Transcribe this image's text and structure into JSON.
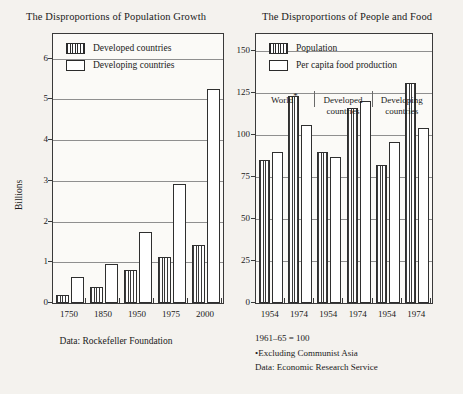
{
  "left": {
    "title": "The Disproportions of Population Growth",
    "ylabel": "Billions",
    "caption": "Data: Rockefeller Foundation",
    "legend": [
      {
        "key": "developed",
        "label": "Developed countries",
        "style": "hatch"
      },
      {
        "key": "developing",
        "label": "Developing countries",
        "style": "open"
      }
    ]
  },
  "right": {
    "title": "The Disproportions of People and Food",
    "legend": [
      {
        "key": "population",
        "label": "Population",
        "style": "hatch"
      },
      {
        "key": "food",
        "label": "Per capita food production",
        "style": "open"
      }
    ],
    "notes": [
      "1961–65 = 100",
      "•Excluding Communist  Asia",
      "Data: Economic Research Service"
    ],
    "group_labels": [
      {
        "line1": "World",
        "line2": "",
        "star": true
      },
      {
        "line1": "Developed",
        "line2": "countries",
        "star": false
      },
      {
        "line1": "Developing",
        "line2": "countries",
        "star": false
      }
    ]
  },
  "chart_data": [
    {
      "type": "bar",
      "title": "The Disproportions of Population Growth",
      "xlabel": "",
      "ylabel": "Billions",
      "categories": [
        "1750",
        "1850",
        "1950",
        "1975",
        "2000"
      ],
      "ylim": [
        0,
        6.6
      ],
      "yticks": [
        0,
        1,
        2,
        3,
        4,
        5,
        6
      ],
      "grid": true,
      "legend_position": "top-left-inside",
      "series": [
        {
          "name": "Developed countries",
          "values": [
            0.2,
            0.4,
            0.8,
            1.13,
            1.42
          ]
        },
        {
          "name": "Developing countries",
          "values": [
            0.65,
            0.95,
            1.75,
            2.93,
            5.25
          ]
        }
      ],
      "source": "Data: Rockefeller Foundation"
    },
    {
      "type": "bar",
      "title": "The Disproportions of People and Food",
      "xlabel": "",
      "ylabel": "",
      "ylim": [
        0,
        160
      ],
      "yticks": [
        0,
        25,
        50,
        75,
        100,
        125,
        150
      ],
      "grid": true,
      "legend_position": "top-left-inside",
      "groups": [
        "World*",
        "Developed countries",
        "Developing countries"
      ],
      "categories": [
        "1954",
        "1974",
        "1954",
        "1974",
        "1954",
        "1974"
      ],
      "series": [
        {
          "name": "Population",
          "values": [
            85,
            123,
            90,
            116,
            82,
            131
          ]
        },
        {
          "name": "Per capita food production",
          "values": [
            90,
            106,
            87,
            120,
            96,
            104
          ]
        }
      ],
      "index_note": "1961–65 = 100",
      "footnote": "*Excluding Communist  Asia",
      "source": "Data: Economic Research Service"
    }
  ]
}
